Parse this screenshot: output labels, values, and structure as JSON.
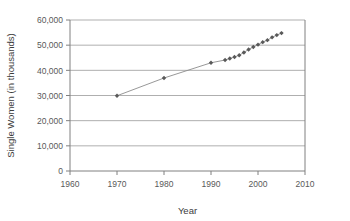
{
  "chart_data": {
    "type": "line",
    "title": "",
    "subtitle": "",
    "xlabel": "Year",
    "ylabel": "Single Women (in thousands)",
    "xlim": [
      1960,
      2010
    ],
    "ylim": [
      0,
      60000
    ],
    "xticks": [
      1960,
      1970,
      1980,
      1990,
      2000,
      2010
    ],
    "xtick_labels": [
      "1960",
      "1970",
      "1980",
      "1990",
      "2000",
      "2010"
    ],
    "yticks": [
      0,
      10000,
      20000,
      30000,
      40000,
      50000,
      60000
    ],
    "ytick_labels": [
      "0",
      "10,000",
      "20,000",
      "30,000",
      "40,000",
      "50,000",
      "60,000"
    ],
    "grid": "horizontal",
    "legend": "none",
    "marker": "diamond",
    "marker_color": "#595959",
    "line_color": "#8c8c8c",
    "x": [
      1970,
      1980,
      1990,
      1993,
      1994,
      1995,
      1996,
      1997,
      1998,
      1999,
      2000,
      2001,
      2002,
      2003,
      2004,
      2005
    ],
    "values": [
      29900,
      36950,
      43000,
      44100,
      44700,
      45300,
      46000,
      47100,
      48300,
      49300,
      50200,
      51200,
      52000,
      53100,
      54000,
      54800
    ],
    "series": [
      {
        "name": "Single Women",
        "x": [
          1970,
          1980,
          1990,
          1993,
          1994,
          1995,
          1996,
          1997,
          1998,
          1999,
          2000,
          2001,
          2002,
          2003,
          2004,
          2005
        ],
        "values": [
          29900,
          36950,
          43000,
          44100,
          44700,
          45300,
          46000,
          47100,
          48300,
          49300,
          50200,
          51200,
          52000,
          53100,
          54000,
          54800
        ]
      }
    ],
    "annotations": []
  },
  "colors": {
    "axis": "#808080",
    "grid": "#a6a6a6",
    "marker": "#595959",
    "line": "#8c8c8c",
    "text": "#3d3d3d",
    "background": "#ffffff"
  }
}
